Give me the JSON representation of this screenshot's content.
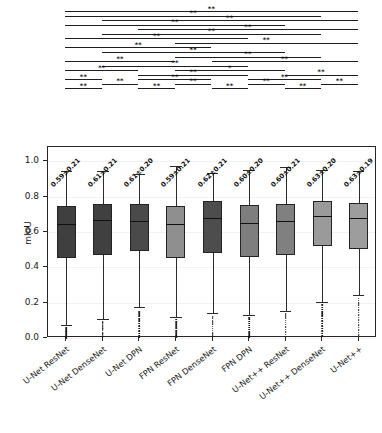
{
  "chart_data": {
    "type": "box",
    "title": "",
    "xlabel": "",
    "ylabel": "mIoU",
    "ylim": [
      0.0,
      1.08
    ],
    "yticks": [
      0.0,
      0.2,
      0.4,
      0.6,
      0.8,
      1.0
    ],
    "ytick_labels": [
      "0.0",
      "0.2",
      "0.4",
      "0.6",
      "0.8",
      "1.0"
    ],
    "grid": true,
    "legend": "none",
    "categories": [
      "U-Net ResNet",
      "U-Net DenseNet",
      "U-Net DPN",
      "FPN ResNet",
      "FPN DenseNet",
      "FPN DPN",
      "U-Net++ ResNet",
      "U-Net++ DenseNet",
      "U-Net++"
    ],
    "stat_labels": [
      "0.59±0.21",
      "0.61±0.21",
      "0.61±0.20",
      "0.59±0.21",
      "0.62±0.21",
      "0.60±0.20",
      "0.60±0.21",
      "0.63±0.20",
      "0.63±0.19"
    ],
    "boxes": [
      {
        "category": "U-Net ResNet",
        "q1": 0.455,
        "median": 0.645,
        "q3": 0.745,
        "whislo": 0.075,
        "whishi": 0.945,
        "fill": "#3f3f3f",
        "outliers": [
          0.06,
          0.052,
          0.045,
          0.038,
          0.03,
          0.024,
          0.018,
          0.012,
          0.006
        ]
      },
      {
        "category": "U-Net DenseNet",
        "q1": 0.47,
        "median": 0.665,
        "q3": 0.755,
        "whislo": 0.105,
        "whishi": 0.945,
        "fill": "#404040",
        "outliers": [
          0.095,
          0.088,
          0.08,
          0.072,
          0.062,
          0.054,
          0.046,
          0.034,
          0.026,
          0.016,
          0.008
        ]
      },
      {
        "category": "U-Net DPN",
        "q1": 0.49,
        "median": 0.66,
        "q3": 0.757,
        "whislo": 0.175,
        "whishi": 0.93,
        "fill": "#4a4a4a",
        "outliers": [
          0.15,
          0.14,
          0.128,
          0.112,
          0.1,
          0.086,
          0.072,
          0.058,
          0.044,
          0.03,
          0.018,
          0.008
        ]
      },
      {
        "category": "FPN ResNet",
        "q1": 0.455,
        "median": 0.645,
        "q3": 0.747,
        "whislo": 0.12,
        "whishi": 0.975,
        "fill": "#8f8f8f",
        "outliers": [
          0.108,
          0.098,
          0.088,
          0.078,
          0.068,
          0.058,
          0.048,
          0.038,
          0.028,
          0.018,
          0.01
        ]
      },
      {
        "category": "FPN DenseNet",
        "q1": 0.478,
        "median": 0.68,
        "q3": 0.775,
        "whislo": 0.14,
        "whishi": 0.935,
        "fill": "#4d4d4d",
        "outliers": [
          0.126,
          0.116,
          0.104,
          0.094,
          0.082,
          0.07,
          0.058,
          0.046,
          0.034,
          0.022,
          0.012
        ]
      },
      {
        "category": "FPN DPN",
        "q1": 0.46,
        "median": 0.65,
        "q3": 0.752,
        "whislo": 0.128,
        "whishi": 0.95,
        "fill": "#7e7e7e",
        "outliers": [
          0.118,
          0.108,
          0.098,
          0.086,
          0.076,
          0.064,
          0.052,
          0.04,
          0.028,
          0.016,
          0.008
        ]
      },
      {
        "category": "U-Net++ ResNet",
        "q1": 0.468,
        "median": 0.66,
        "q3": 0.755,
        "whislo": 0.152,
        "whishi": 0.965,
        "fill": "#808080",
        "outliers": [
          0.14,
          0.128,
          0.116,
          0.104,
          0.092,
          0.08,
          0.066,
          0.052,
          0.038,
          0.024,
          0.012
        ]
      },
      {
        "category": "U-Net++ DenseNet",
        "q1": 0.52,
        "median": 0.69,
        "q3": 0.775,
        "whislo": 0.205,
        "whishi": 0.95,
        "fill": "#9a9a9a",
        "outliers": [
          0.19,
          0.178,
          0.166,
          0.152,
          0.14,
          0.128,
          0.114,
          0.1,
          0.086,
          0.072,
          0.058,
          0.044,
          0.03,
          0.016
        ]
      },
      {
        "category": "U-Net++",
        "q1": 0.505,
        "median": 0.68,
        "q3": 0.762,
        "whislo": 0.245,
        "whishi": 0.945,
        "fill": "#9d9d9d",
        "outliers": [
          0.228,
          0.216,
          0.202,
          0.19,
          0.176,
          0.162,
          0.148,
          0.134,
          0.12,
          0.106,
          0.092,
          0.078,
          0.064,
          0.05,
          0.036,
          0.022
        ]
      }
    ],
    "significance_brackets": [
      {
        "row": 0,
        "from": 0,
        "to": 8,
        "label": "**"
      },
      {
        "row": 1,
        "from": 0,
        "to": 7,
        "label": "**"
      },
      {
        "row": 2,
        "from": 1,
        "to": 8,
        "label": "**"
      },
      {
        "row": 3,
        "from": 0,
        "to": 6,
        "label": "**"
      },
      {
        "row": 4,
        "from": 2,
        "to": 8,
        "label": "**"
      },
      {
        "row": 5,
        "from": 1,
        "to": 7,
        "label": "**"
      },
      {
        "row": 6,
        "from": 0,
        "to": 5,
        "label": "**"
      },
      {
        "row": 7,
        "from": 3,
        "to": 8,
        "label": "**"
      },
      {
        "row": 8,
        "from": 0,
        "to": 4,
        "label": "**"
      },
      {
        "row": 9,
        "from": 1,
        "to": 6,
        "label": "**"
      },
      {
        "row": 10,
        "from": 3,
        "to": 7,
        "label": "**"
      },
      {
        "row": 11,
        "from": 0,
        "to": 3,
        "label": "**"
      },
      {
        "row": 11,
        "from": 4,
        "to": 8,
        "label": "**"
      },
      {
        "row": 12,
        "from": 1,
        "to": 5,
        "label": "**"
      },
      {
        "row": 13,
        "from": 0,
        "to": 2,
        "label": "**"
      },
      {
        "row": 13,
        "from": 3,
        "to": 6,
        "label": "*"
      },
      {
        "row": 14,
        "from": 2,
        "to": 5,
        "label": "**"
      },
      {
        "row": 14,
        "from": 6,
        "to": 8,
        "label": "**"
      },
      {
        "row": 15,
        "from": 0,
        "to": 1,
        "label": "**"
      },
      {
        "row": 15,
        "from": 2,
        "to": 4,
        "label": "**"
      },
      {
        "row": 15,
        "from": 5,
        "to": 7,
        "label": "**"
      },
      {
        "row": 16,
        "from": 1,
        "to": 2,
        "label": "**"
      },
      {
        "row": 16,
        "from": 3,
        "to": 4,
        "label": "**"
      },
      {
        "row": 16,
        "from": 5,
        "to": 6,
        "label": "**"
      },
      {
        "row": 16,
        "from": 7,
        "to": 8,
        "label": "**"
      },
      {
        "row": 17,
        "from": 0,
        "to": 1,
        "label": "**"
      },
      {
        "row": 17,
        "from": 2,
        "to": 3,
        "label": "**"
      },
      {
        "row": 17,
        "from": 4,
        "to": 5,
        "label": "**"
      },
      {
        "row": 17,
        "from": 6,
        "to": 7,
        "label": "**"
      }
    ]
  }
}
